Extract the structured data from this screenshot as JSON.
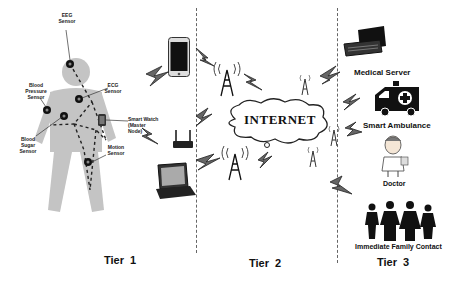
{
  "diagram": {
    "type": "three-tier IoT healthcare architecture",
    "tiers": [
      {
        "label": "Tier  1"
      },
      {
        "label": "Tier  2"
      },
      {
        "label": "Tier  3"
      }
    ],
    "tier1": {
      "sensors": [
        {
          "label": "EEG\nSensor"
        },
        {
          "label": "ECG\nSensor"
        },
        {
          "label": "Blood\nPressure\nSensor"
        },
        {
          "label": "Blood\nSugar\nSensor"
        },
        {
          "label": "Motion\nSensor"
        }
      ],
      "smart_watch_label": "Smart Watch\n(Master\nNode)"
    },
    "tier2": {
      "devices": [
        "smartphone",
        "wifi-router",
        "laptop"
      ],
      "cloud_label": "INTERNET"
    },
    "tier3": {
      "items": [
        {
          "label": "Medical Server"
        },
        {
          "label": "Smart Ambulance"
        },
        {
          "label": "Doctor"
        },
        {
          "label": "Immediate Family Contact"
        }
      ]
    },
    "colors": {
      "body": "#c4c4c4",
      "sensor": "#111111",
      "line": "#222222",
      "divider": "#666666",
      "bolt_fill": "#555555"
    }
  }
}
